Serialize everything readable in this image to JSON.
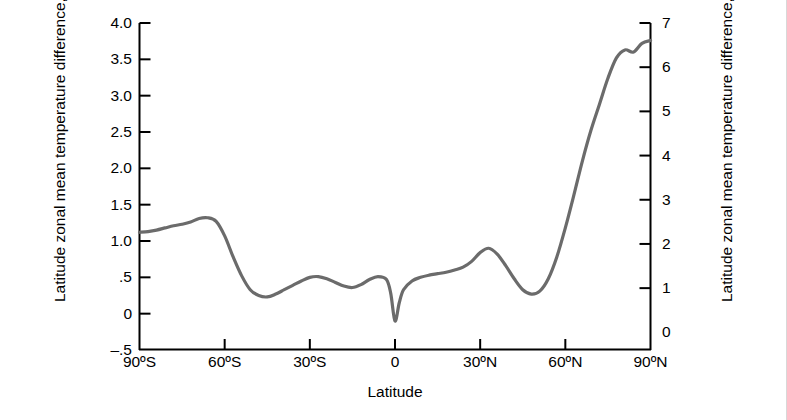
{
  "chart_data": {
    "type": "line",
    "title": "",
    "xlabel": "Latitude",
    "ylabel": "Latitude zonal mean temperature difference, °C",
    "ylabel_right": "Latitude zonal mean temperature difference, °F",
    "xlim": [
      -90,
      90
    ],
    "ylim": [
      -0.5,
      4.0
    ],
    "ylim_right": [
      -0.4,
      7.0
    ],
    "grid": false,
    "legend": "none",
    "line_color": "#6b6b6b",
    "axis_color": "#000000",
    "xticks": [
      -90,
      -60,
      -30,
      0,
      30,
      60,
      90
    ],
    "xticklabels": [
      "90ºS",
      "60ºS",
      "30ºS",
      "0",
      "30ºN",
      "60ºN",
      "90ºN"
    ],
    "yticks_left": [
      -0.5,
      0,
      0.5,
      1.0,
      1.5,
      2.0,
      2.5,
      3.0,
      3.5,
      4.0
    ],
    "yticklabels_left": [
      "–.5",
      "0",
      ".5",
      "1.0",
      "1.5",
      "2.0",
      "2.5",
      "3.0",
      "3.5",
      "4.0"
    ],
    "yticks_right": [
      0,
      1,
      2,
      3,
      4,
      5,
      6,
      7
    ],
    "yticklabels_right": [
      "0",
      "1",
      "2",
      "3",
      "4",
      "5",
      "6",
      "7"
    ],
    "series": [
      {
        "name": "Latitude zonal mean temperature difference",
        "x": [
          -90,
          -87,
          -84,
          -81,
          -78,
          -75,
          -72,
          -69,
          -66,
          -63,
          -60,
          -57,
          -54,
          -51,
          -48,
          -45,
          -42,
          -39,
          -36,
          -33,
          -30,
          -27,
          -24,
          -21,
          -18,
          -15,
          -12,
          -9,
          -6,
          -3,
          -1.5,
          0,
          1.5,
          3,
          6,
          9,
          12,
          15,
          18,
          21,
          24,
          27,
          30,
          33,
          36,
          39,
          42,
          45,
          48,
          51,
          54,
          57,
          60,
          63,
          66,
          69,
          72,
          75,
          78,
          81,
          84,
          87,
          90
        ],
        "y": [
          1.12,
          1.13,
          1.15,
          1.18,
          1.21,
          1.23,
          1.26,
          1.31,
          1.32,
          1.27,
          1.07,
          0.78,
          0.52,
          0.33,
          0.25,
          0.23,
          0.27,
          0.33,
          0.39,
          0.45,
          0.5,
          0.51,
          0.48,
          0.43,
          0.38,
          0.36,
          0.4,
          0.47,
          0.51,
          0.47,
          0.28,
          -0.1,
          0.15,
          0.33,
          0.45,
          0.5,
          0.53,
          0.55,
          0.57,
          0.6,
          0.64,
          0.72,
          0.84,
          0.9,
          0.82,
          0.66,
          0.48,
          0.33,
          0.27,
          0.31,
          0.48,
          0.78,
          1.18,
          1.63,
          2.1,
          2.52,
          2.88,
          3.24,
          3.52,
          3.63,
          3.6,
          3.72,
          3.76
        ]
      }
    ]
  },
  "figure": {
    "x_axis_label": "Latitude",
    "y_axis_label_left": "Latitude zonal mean temperature difference, °C",
    "y_axis_label_right": "Latitude zonal mean temperature difference, °F"
  }
}
